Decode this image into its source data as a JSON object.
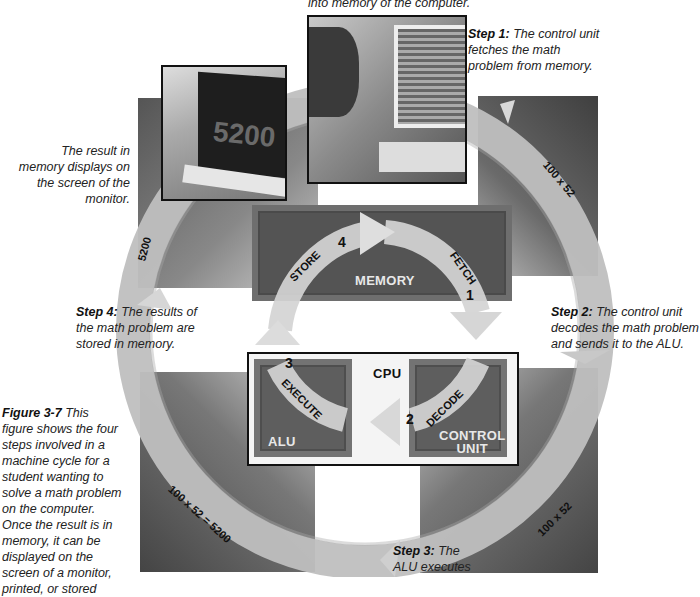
{
  "figure": {
    "caption_bold": "Figure 3-7",
    "caption_text": " This figure shows the four steps involved in a machine cycle for a student wanting to solve a math problem on the computer. Once the result is in memory, it can be displayed on the screen of a monitor, printed, or stored"
  },
  "top_caption": "into memory of the computer.",
  "steps": [
    {
      "bold": "Step 1:",
      "text": " The control unit fetches the math problem from memory."
    },
    {
      "bold": "Step 2:",
      "text": " The control unit decodes the math problem and sends it to the ALU."
    },
    {
      "bold": "Step 3:",
      "text": " The ALU executes"
    },
    {
      "bold": "Step 4:",
      "text": " The results of the math problem are stored in memory."
    }
  ],
  "result_caption": "The result in memory displays on the screen of the monitor.",
  "monitor_display": "5200",
  "ring_labels": {
    "top_right": "100 x 52",
    "bottom_right": "100 x 52",
    "bottom_left": "100 x 52 = 5200",
    "top_left": "5200"
  },
  "components": {
    "memory": "MEMORY",
    "cpu": "CPU",
    "alu": "ALU",
    "control_unit_line1": "CONTROL",
    "control_unit_line2": "UNIT"
  },
  "cycle": [
    {
      "num": "1",
      "label": "FETCH"
    },
    {
      "num": "2",
      "label": "DECODE"
    },
    {
      "num": "3",
      "label": "EXECUTE"
    },
    {
      "num": "4",
      "label": "STORE"
    }
  ],
  "colors": {
    "dark_square": "#4a4a4a",
    "ring": "#b8b8b8",
    "box_fill": "#5c5c5c",
    "arrow": "#d0d0d0"
  }
}
